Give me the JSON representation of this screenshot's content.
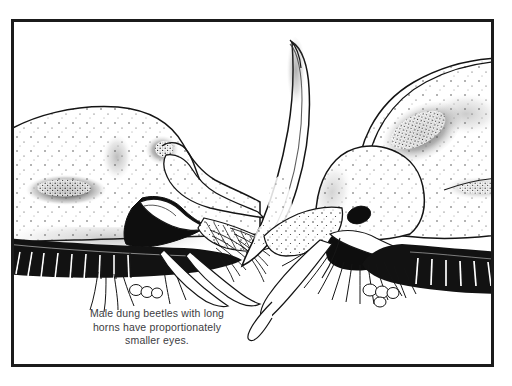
{
  "figure": {
    "domain": "Natural-Image",
    "kind": "scientific-line-illustration",
    "background_color": "#ffffff",
    "frame": {
      "color": "#1b1b1b",
      "thickness_px": 3,
      "x": 11,
      "y": 19,
      "width": 483,
      "height": 348
    }
  },
  "caption": {
    "full_text": "Male dung beetles with long horns have proportionately smaller eyes.",
    "align": "center",
    "color": "#3c3c41",
    "lines": [
      "Male dung beetles with long",
      "horns have proportionately",
      "smaller eyes."
    ]
  },
  "specimens": [
    {
      "id": "left-beetle",
      "name": "short-horned-male-beetle",
      "facing": "right",
      "horn": "short",
      "eye": "large",
      "eye_rendering": "large stippled oval",
      "description": "Head and pronotum of a short-horned male dung beetle in left profile, showing a proportionately large compound eye.",
      "ink_color": "#141414",
      "fill_color": "#ffffff"
    },
    {
      "id": "right-beetle",
      "name": "long-horned-male-beetle",
      "facing": "left",
      "horn": "long",
      "eye": "small",
      "eye_rendering": "small solid black oval",
      "description": "Head and pronotum of a long-horned male dung beetle in right profile, with a long curved cephalic horn and a proportionately small compound eye.",
      "ink_color": "#141414",
      "fill_color": "#ffffff"
    }
  ],
  "labels": {
    "left_specimen_alt": "Short-horned male dung beetle, large eye",
    "right_specimen_alt": "Long-horned male dung beetle, small eye"
  }
}
